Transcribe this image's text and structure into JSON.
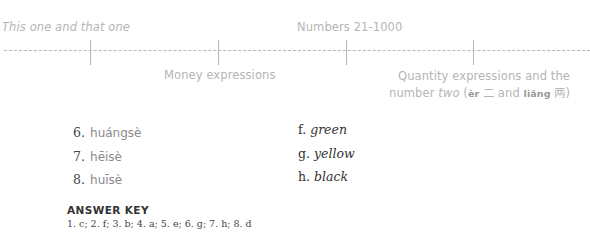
{
  "timeline": {
    "top_labels": [
      {
        "text": "This one and that one",
        "italic": true
      },
      {
        "text": "Numbers 21-1000",
        "italic": false
      }
    ],
    "bottom_labels": [
      {
        "text": "Money expressions"
      },
      {
        "line1": "Quantity expressions and the",
        "line2_prefix": "number ",
        "line2_italic": "two",
        "line2_open": " (",
        "er_pinyin": "èr",
        "er_hanzi": " 二",
        "and": " and ",
        "liang_pinyin": "liǎng",
        "liang_hanzi": " 两",
        "close": ")"
      }
    ],
    "tick_positions_px": [
      90,
      218,
      346,
      473
    ],
    "line_color": "#b8b8b8",
    "label_color": "#b5b5b5"
  },
  "exercise": {
    "items": [
      {
        "number": "6.",
        "pinyin": "huángsè"
      },
      {
        "number": "7.",
        "pinyin": "hēisè"
      },
      {
        "number": "8.",
        "pinyin": "huīsè"
      }
    ],
    "options": [
      {
        "letter": "f.",
        "word": "green"
      },
      {
        "letter": "g.",
        "word": "yellow"
      },
      {
        "letter": "h.",
        "word": "black"
      }
    ]
  },
  "answer_key": {
    "title": "ANSWER KEY",
    "body": "1. c; 2. f; 3. b; 4. a; 5. e; 6. g; 7. h; 8. d"
  }
}
